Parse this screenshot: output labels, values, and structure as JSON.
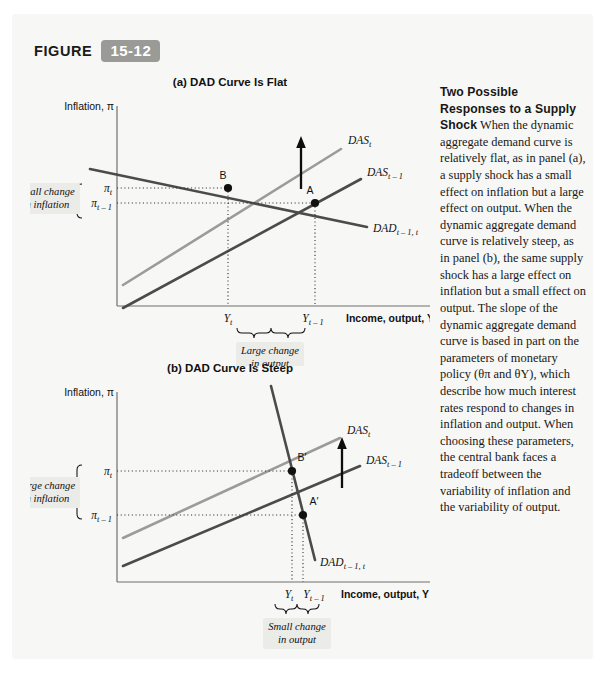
{
  "figure": {
    "label": "FIGURE",
    "number": "15-12"
  },
  "panels": [
    {
      "id": "a",
      "title": "(a) DAD Curve Is Flat",
      "y_axis_label": "Inflation, π",
      "x_axis_label": "Income, output, Y",
      "curves": [
        {
          "name": "das-t",
          "base": "DAS",
          "sub": "t"
        },
        {
          "name": "das-t-1",
          "base": "DAS",
          "sub": "t – 1"
        },
        {
          "name": "dad-t-1-t",
          "base": "DAD",
          "sub": "t – 1, t"
        }
      ],
      "points": [
        {
          "name": "point-b",
          "label": "B"
        },
        {
          "name": "point-a",
          "label": "A"
        }
      ],
      "y_ticks": [
        {
          "base": "π",
          "sub": "t"
        },
        {
          "base": "π",
          "sub": "t – 1"
        }
      ],
      "x_ticks": [
        {
          "base": "Y",
          "sub": "t"
        },
        {
          "base": "Y",
          "sub": "t – 1"
        }
      ],
      "callout_inflation": "Small change\nin inflation",
      "callout_inflation_line1": "Small change",
      "callout_inflation_line2": "in inflation",
      "callout_output_line1": "Large change",
      "callout_output_line2": "in output"
    },
    {
      "id": "b",
      "title": "(b) DAD Curve Is Steep",
      "y_axis_label": "Inflation, π",
      "x_axis_label": "Income, output, Y",
      "curves": [
        {
          "name": "das-t",
          "base": "DAS",
          "sub": "t"
        },
        {
          "name": "das-t-1",
          "base": "DAS",
          "sub": "t – 1"
        },
        {
          "name": "dad-t-1-t",
          "base": "DAD",
          "sub": "t – 1, t"
        }
      ],
      "points": [
        {
          "name": "point-b-prime",
          "label": "B′"
        },
        {
          "name": "point-a-prime",
          "label": "A′"
        }
      ],
      "y_ticks": [
        {
          "base": "π",
          "sub": "t"
        },
        {
          "base": "π",
          "sub": "t – 1"
        }
      ],
      "x_ticks": [
        {
          "base": "Y",
          "sub": "t"
        },
        {
          "base": "Y",
          "sub": "t – 1"
        }
      ],
      "callout_inflation_line1": "Large change",
      "callout_inflation_line2": "in inflation",
      "callout_output_line1": "Small change",
      "callout_output_line2": "in output"
    }
  ],
  "caption": {
    "heading": "Two Possible Responses to a Supply Shock",
    "body": " When the dynamic aggregate demand curve is relatively flat, as in panel (a), a supply shock has a small effect on inflation but a large effect on output. When the dynamic aggregate demand curve is relatively steep, as in panel (b), the same supply shock has a large effect on inflation but a small effect on output. The slope of the dynamic aggregate demand curve is based in part on the parameters of monetary policy (θπ and θY), which describe how much interest rates respond to changes in inflation and output. When choosing these parameters, the central bank faces a tradeoff between the variability of inflation and the variability of output."
  },
  "colors": {
    "curve_dark": "#4b4b4b",
    "curve_light": "#9b9b9b",
    "card_background": "#f7f7f5",
    "badge": "#9a9a96",
    "callout_background": "#ebebe8"
  }
}
